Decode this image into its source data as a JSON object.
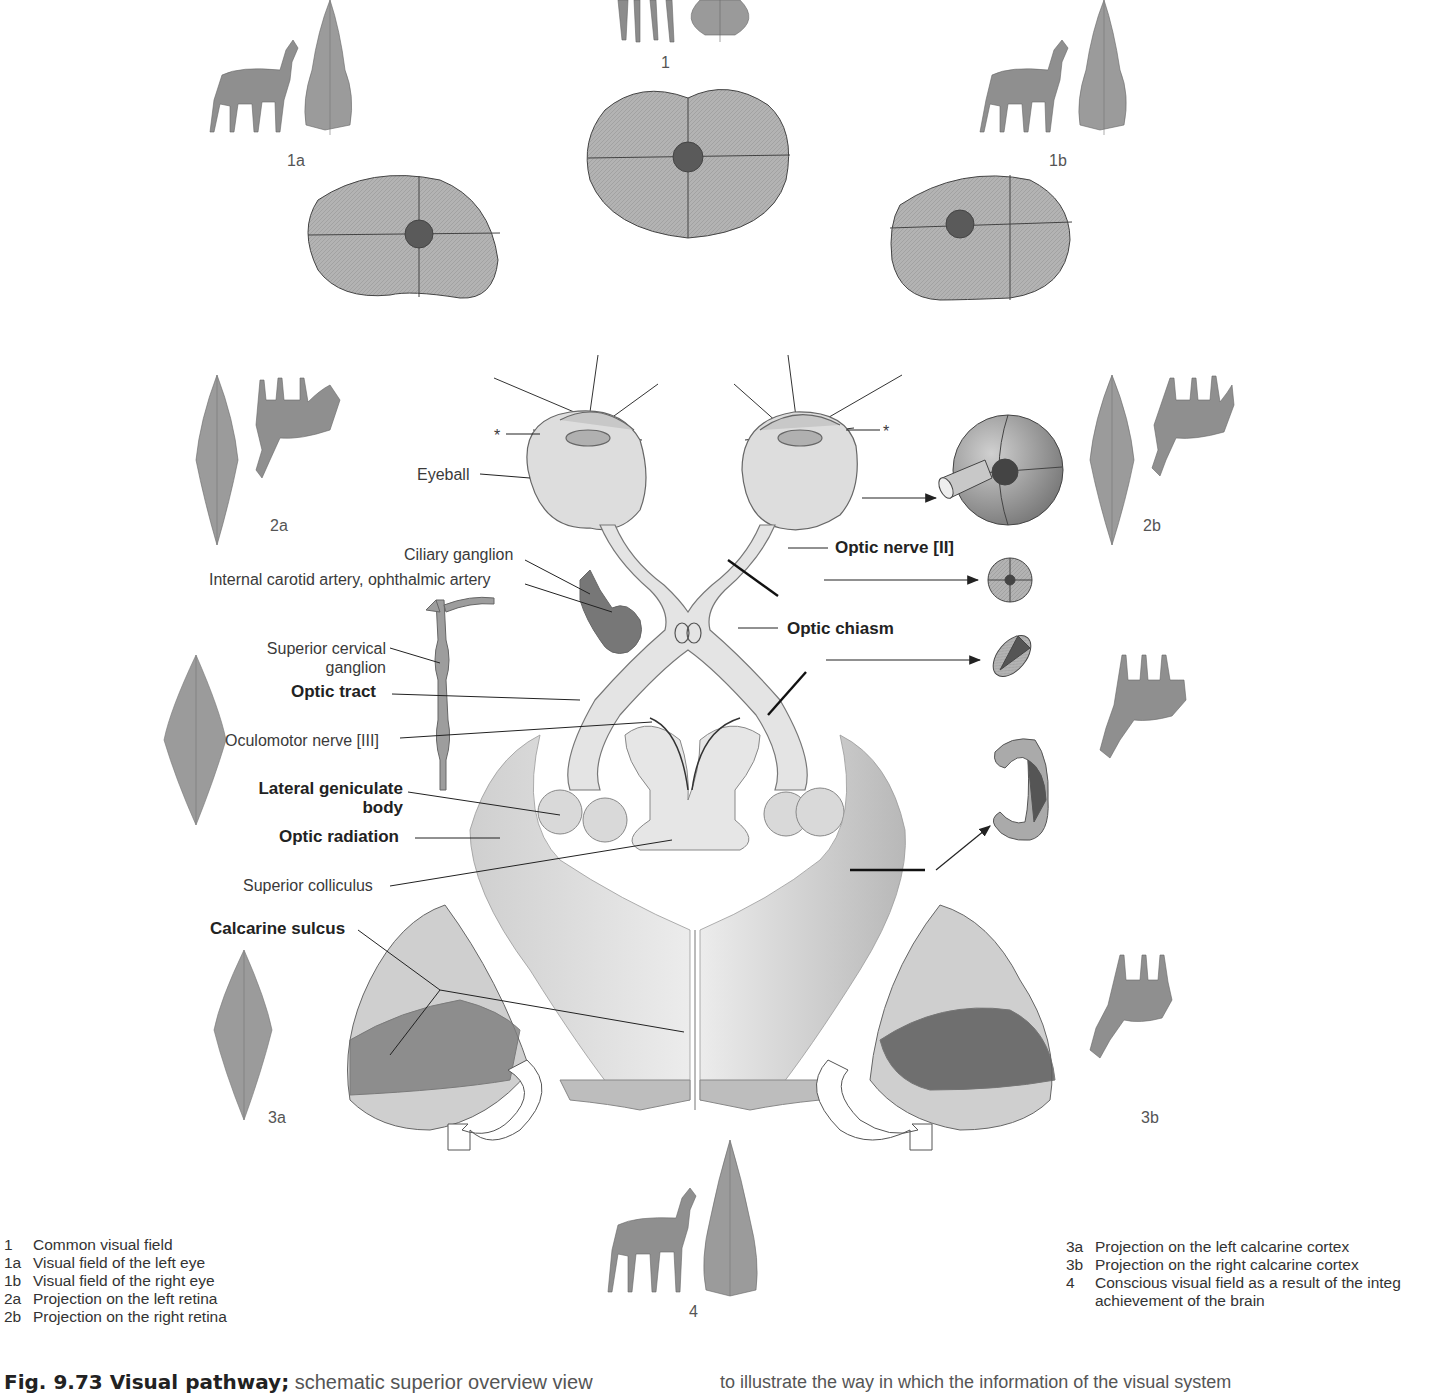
{
  "figure": {
    "caption_title": "Fig. 9.73 Visual pathway;",
    "caption_text": "schematic superior overview view",
    "caption_continued": "to illustrate the way in which the information of the visual system"
  },
  "panel_numbers": {
    "n1": "1",
    "n1a": "1a",
    "n1b": "1b",
    "n2a": "2a",
    "n2b": "2b",
    "n3a": "3a",
    "n3b": "3b",
    "n4": "4"
  },
  "labels": {
    "eyeball": "Eyeball",
    "ciliary_ganglion": "Ciliary ganglion",
    "internal_carotid": "Internal carotid artery, ophthalmic artery",
    "superior_cervical_1": "Superior cervical",
    "superior_cervical_2": "ganglion",
    "optic_tract": "Optic tract",
    "oculomotor_nerve": "Oculomotor nerve [III]",
    "lateral_geniculate_1": "Lateral geniculate",
    "lateral_geniculate_2": "body",
    "optic_radiation": "Optic radiation",
    "superior_colliculus": "Superior colliculus",
    "calcarine_sulcus": "Calcarine sulcus",
    "optic_nerve": "Optic nerve [II]",
    "optic_chiasm": "Optic chiasm",
    "asterisk": "*"
  },
  "legend_left": [
    {
      "key": "1",
      "text": "Common visual field"
    },
    {
      "key": "1a",
      "text": "Visual field of the left eye"
    },
    {
      "key": "1b",
      "text": "Visual field of the right eye"
    },
    {
      "key": "2a",
      "text": "Projection on the left retina"
    },
    {
      "key": "2b",
      "text": "Projection on the right retina"
    }
  ],
  "legend_right": [
    {
      "key": "3a",
      "text": "Projection on the left calcarine cortex"
    },
    {
      "key": "3b",
      "text": "Projection on the right calcarine cortex"
    },
    {
      "key": "4",
      "text": "Conscious visual field as a result of the integ"
    },
    {
      "key": "",
      "text": "achievement of the brain"
    }
  ],
  "colors": {
    "field_fill": "#b5b5b5",
    "field_dark": "#5a5a5a",
    "tissue": "#e2e2e2",
    "line": "#2a2a2a"
  }
}
